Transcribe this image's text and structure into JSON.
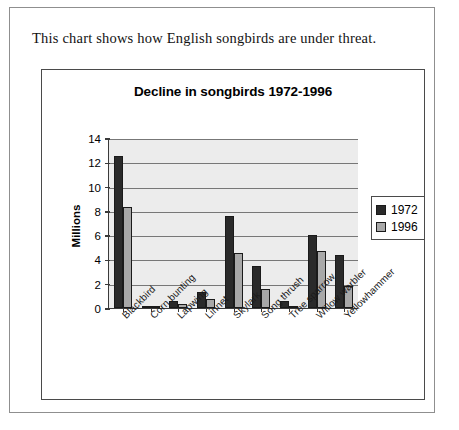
{
  "caption": "This chart shows how English songbirds are under threat.",
  "chart_data": {
    "type": "bar",
    "title": "Decline in songbirds 1972-1996",
    "xlabel": "",
    "ylabel": "Millions",
    "ylim": [
      0,
      14
    ],
    "ytick_step": 2,
    "yticks": [
      "14",
      "12",
      "10",
      "8",
      "6",
      "4",
      "2",
      "0"
    ],
    "grid": true,
    "legend_position": "right",
    "categories": [
      "Blackbird",
      "Corn bunting",
      "Lapwing",
      "Linnet",
      "Skylark",
      "Song thrush",
      "Tree sparrow",
      "Willow warbler",
      "Yellowhammer"
    ],
    "series": [
      {
        "name": "1972",
        "color": "#2a2a2a",
        "values": [
          12.5,
          0.15,
          0.6,
          1.3,
          7.6,
          3.5,
          0.55,
          6.0,
          4.4
        ]
      },
      {
        "name": "1996",
        "color": "#a8a8a8",
        "values": [
          8.3,
          0.1,
          0.35,
          0.75,
          4.5,
          1.6,
          0.1,
          4.7,
          1.8
        ]
      }
    ]
  }
}
